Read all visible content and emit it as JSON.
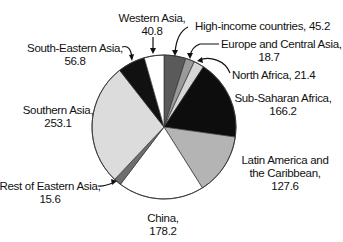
{
  "chart_data": {
    "type": "pie",
    "title": "",
    "start_angle_deg": 0,
    "direction": "clockwise",
    "slices": [
      {
        "name": "High-income countries",
        "value": 45.2,
        "color": "#5a5a5a",
        "label_line1": "High-income countries, 45.2",
        "label_line2": ""
      },
      {
        "name": "Europe and Central Asia",
        "value": 18.7,
        "color": "#9a9a9a",
        "label_line1": "Europe and Central Asia,",
        "label_line2": "18.7"
      },
      {
        "name": "North Africa",
        "value": 21.4,
        "color": "#d6d6d6",
        "label_line1": "North Africa, 21.4",
        "label_line2": ""
      },
      {
        "name": "Sub-Saharan Africa",
        "value": 166.2,
        "color": "#0d0d0d",
        "label_line1": "Sub-Saharan Africa,",
        "label_line2": "166.2"
      },
      {
        "name": "Latin America and the Caribbean",
        "value": 127.6,
        "color": "#b4b4b4",
        "label_line1": "Latin America and",
        "label_line2": "the Caribbean,",
        "label_line3": "127.6"
      },
      {
        "name": "China",
        "value": 178.2,
        "color": "#ffffff",
        "label_line1": "China,",
        "label_line2": "178.2"
      },
      {
        "name": "Rest of Eastern Asia",
        "value": 15.6,
        "color": "#6e6e6e",
        "label_line1": "Rest of Eastern Asia,",
        "label_line2": "15.6"
      },
      {
        "name": "Southern Asia",
        "value": 253.1,
        "color": "#dcdcdc",
        "label_line1": "Southern Asia,",
        "label_line2": "253.1"
      },
      {
        "name": "South-Eastern Asia",
        "value": 56.8,
        "color": "#111111",
        "label_line1": "South-Eastern Asia,",
        "label_line2": "56.8"
      },
      {
        "name": "Western Asia",
        "value": 40.8,
        "color": "#ffffff",
        "label_line1": "Western Asia,",
        "label_line2": "40.8"
      }
    ],
    "legend": "none (direct labels with arrows)"
  }
}
